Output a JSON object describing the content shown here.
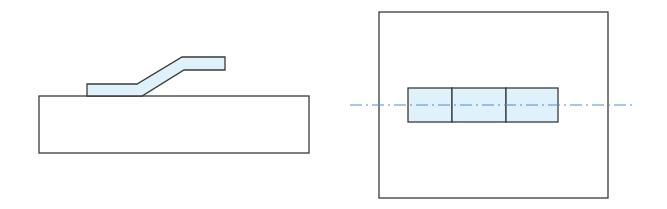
{
  "diagram": {
    "colors": {
      "outline": "#3a3a3a",
      "fill": "#dff1fa",
      "centerline": "#4a8fd6",
      "background": "#ffffff"
    },
    "views": [
      {
        "name": "side-view",
        "parts": [
          "base-plate",
          "bent-strip"
        ]
      },
      {
        "name": "top-view",
        "parts": [
          "outer-plate",
          "strip-segment-1",
          "strip-segment-2",
          "strip-segment-3",
          "centerline"
        ]
      }
    ]
  }
}
